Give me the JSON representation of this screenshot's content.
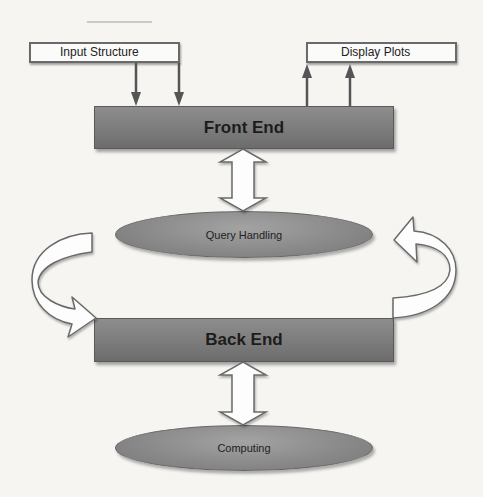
{
  "diagram": {
    "input_box": {
      "label": "Input Structure"
    },
    "output_box": {
      "label": "Display Plots"
    },
    "front_end": {
      "label": "Front End"
    },
    "query_handling": {
      "label": "Query Handling"
    },
    "back_end": {
      "label": "Back End"
    },
    "computing": {
      "label": "Computing"
    },
    "connections": [
      {
        "from": "Input Structure",
        "to": "Front End",
        "type": "arrow",
        "count": 2
      },
      {
        "from": "Front End",
        "to": "Display Plots",
        "type": "arrow",
        "count": 2
      },
      {
        "from": "Front End",
        "to": "Query Handling",
        "type": "bidirectional-block-arrow"
      },
      {
        "from": "Query Handling",
        "to": "Back End",
        "type": "curved-block-arrow",
        "side": "left"
      },
      {
        "from": "Back End",
        "to": "Query Handling",
        "type": "curved-block-arrow",
        "side": "right"
      },
      {
        "from": "Back End",
        "to": "Computing",
        "type": "bidirectional-block-arrow"
      }
    ],
    "colors": {
      "background": "#f6f5f2",
      "block_fill": "#7d7d7d",
      "pill_fill": "#8e8e8e",
      "outline": "#5e5e5e",
      "io_box_fill": "#fbfbfa"
    }
  }
}
